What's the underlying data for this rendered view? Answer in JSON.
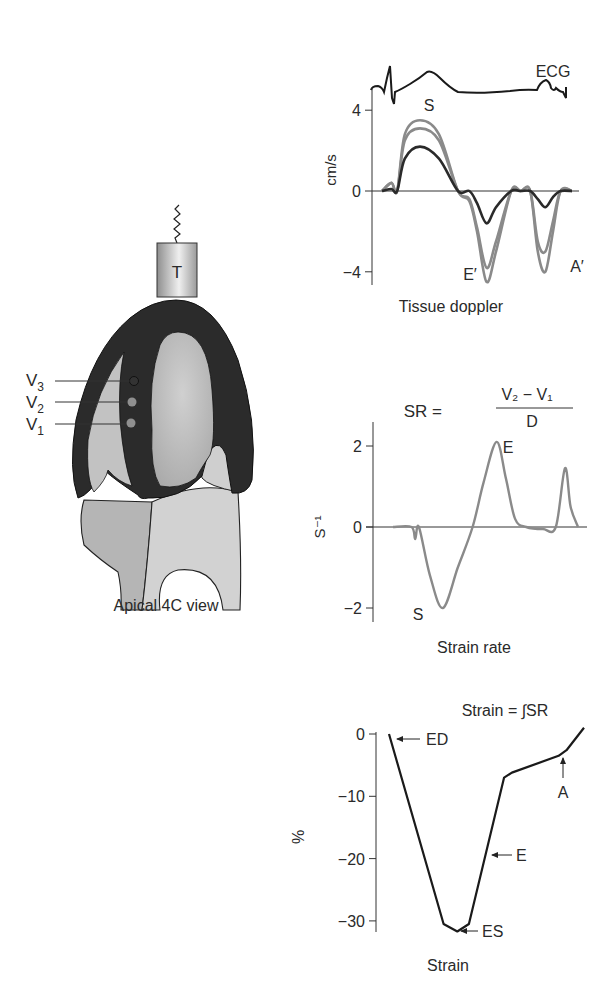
{
  "figure": {
    "heart": {
      "caption": "Apical 4C view",
      "transducer_label": "T",
      "velocity_points": [
        {
          "label": "V",
          "sub": "3"
        },
        {
          "label": "V",
          "sub": "2"
        },
        {
          "label": "V",
          "sub": "1"
        }
      ],
      "colors": {
        "myocardium": "#2b2b2b",
        "chamber": "#bdbdbd",
        "atria": "#c8c8c8"
      }
    }
  },
  "chart_data": [
    {
      "type": "line",
      "title": "Tissue doppler",
      "ylabel": "cm/s",
      "ylim": [
        -4.6,
        5
      ],
      "yticks": [
        4,
        0,
        -4
      ],
      "ytick_labels": [
        "4",
        "0",
        "−4"
      ],
      "ecg_label": "ECG",
      "annotations": [
        "S",
        "E′",
        "A′"
      ],
      "x": [
        0,
        0.05,
        0.08,
        0.12,
        0.2,
        0.3,
        0.4,
        0.46,
        0.5,
        0.55,
        0.6,
        0.68,
        0.73,
        0.78,
        0.82,
        0.86,
        0.9,
        0.94,
        1.0
      ],
      "series": [
        {
          "name": "V3 (outer)",
          "color": "#8a8a8a",
          "values": [
            0,
            0.4,
            0,
            2.8,
            3.5,
            2.8,
            0,
            -0.5,
            -2.0,
            -4.5,
            -3.0,
            0,
            0,
            0,
            -3.0,
            -4.0,
            -2.0,
            0,
            0
          ]
        },
        {
          "name": "V2",
          "color": "#8a8a8a",
          "values": [
            0,
            0.4,
            0,
            2.5,
            3.1,
            2.5,
            0,
            -0.4,
            -1.8,
            -3.8,
            -2.5,
            0,
            0,
            0,
            -2.5,
            -3.0,
            -1.5,
            0,
            0
          ]
        },
        {
          "name": "V1",
          "color": "#2a2a2a",
          "values": [
            0,
            0.1,
            0,
            1.6,
            2.2,
            1.6,
            0,
            0,
            -0.6,
            -1.6,
            -0.8,
            0,
            0,
            0,
            -0.4,
            -0.8,
            -0.3,
            0,
            0
          ]
        }
      ]
    },
    {
      "type": "line",
      "title": "Strain rate",
      "ylabel": "S⁻¹",
      "formula": {
        "lhs": "SR =",
        "numerator": "V₂ − V₁",
        "denominator": "D"
      },
      "ylim": [
        -2.2,
        2.6
      ],
      "yticks": [
        2,
        0,
        -2
      ],
      "ytick_labels": [
        "2",
        "0",
        "−2"
      ],
      "annotations": [
        "S",
        "E"
      ],
      "x": [
        0,
        0.1,
        0.12,
        0.14,
        0.2,
        0.27,
        0.35,
        0.43,
        0.49,
        0.56,
        0.61,
        0.66,
        0.72,
        0.81,
        0.88,
        0.93,
        0.96,
        1.0
      ],
      "series": [
        {
          "name": "Strain rate",
          "color": "#8a8a8a",
          "values": [
            0,
            0,
            -0.3,
            0,
            -1.2,
            -2.0,
            -1.0,
            0,
            1.1,
            2.1,
            1.2,
            0.2,
            0,
            -0.05,
            0,
            1.45,
            0.5,
            0
          ]
        }
      ]
    },
    {
      "type": "line",
      "title": "Strain",
      "ylabel": "%",
      "formula": "Strain = ∫SR",
      "ylim": [
        -32,
        1
      ],
      "yticks": [
        0,
        -10,
        -20,
        -30
      ],
      "ytick_labels": [
        "0",
        "−10",
        "−20",
        "−30"
      ],
      "annotations": [
        "ED",
        "ES",
        "E",
        "A"
      ],
      "x": [
        0,
        0.28,
        0.35,
        0.41,
        0.59,
        0.63,
        0.87,
        0.91,
        1.0
      ],
      "series": [
        {
          "name": "Strain",
          "color": "#1a1a1a",
          "values": [
            0,
            -30.5,
            -31.7,
            -30.5,
            -7.0,
            -6.2,
            -3.5,
            -2.6,
            1.0
          ]
        }
      ]
    }
  ]
}
